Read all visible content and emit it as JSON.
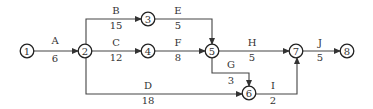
{
  "diagram": {
    "type": "activity-on-arrow network",
    "nodes": [
      {
        "id": "1",
        "label": "1",
        "x": 27,
        "y": 51
      },
      {
        "id": "2",
        "label": "2",
        "x": 85,
        "y": 51
      },
      {
        "id": "3",
        "label": "3",
        "x": 148,
        "y": 19
      },
      {
        "id": "4",
        "label": "4",
        "x": 148,
        "y": 51
      },
      {
        "id": "5",
        "label": "5",
        "x": 212,
        "y": 51
      },
      {
        "id": "6",
        "label": "6",
        "x": 249,
        "y": 93
      },
      {
        "id": "7",
        "label": "7",
        "x": 296,
        "y": 51
      },
      {
        "id": "8",
        "label": "8",
        "x": 347,
        "y": 51
      }
    ],
    "edges": [
      {
        "activity": "A",
        "duration": "6",
        "from": "1",
        "to": "2",
        "path": [
          [
            33,
            51
          ],
          [
            78,
            51
          ]
        ],
        "name_pos": [
          55,
          44
        ],
        "dur_pos": [
          55,
          62
        ]
      },
      {
        "activity": "B",
        "duration": "15",
        "from": "2",
        "to": "3",
        "path": [
          [
            86,
            45
          ],
          [
            86,
            19
          ],
          [
            141,
            19
          ]
        ],
        "name_pos": [
          116,
          14
        ],
        "dur_pos": [
          116,
          29
        ]
      },
      {
        "activity": "C",
        "duration": "12",
        "from": "2",
        "to": "4",
        "path": [
          [
            91,
            51
          ],
          [
            141,
            51
          ]
        ],
        "name_pos": [
          116,
          46
        ],
        "dur_pos": [
          116,
          61
        ]
      },
      {
        "activity": "D",
        "duration": "18",
        "from": "2",
        "to": "6",
        "path": [
          [
            86,
            57
          ],
          [
            86,
            94
          ],
          [
            242,
            94
          ]
        ],
        "name_pos": [
          148,
          89
        ],
        "dur_pos": [
          148,
          104
        ]
      },
      {
        "activity": "E",
        "duration": "5",
        "from": "3",
        "to": "5",
        "path": [
          [
            155,
            19
          ],
          [
            212,
            19
          ],
          [
            212,
            44
          ]
        ],
        "name_pos": [
          178,
          14
        ],
        "dur_pos": [
          178,
          29
        ]
      },
      {
        "activity": "F",
        "duration": "8",
        "from": "4",
        "to": "5",
        "path": [
          [
            155,
            51
          ],
          [
            205,
            51
          ]
        ],
        "name_pos": [
          178,
          46
        ],
        "dur_pos": [
          178,
          61
        ]
      },
      {
        "activity": "G",
        "duration": "3",
        "from": "5",
        "to": "6",
        "path": [
          [
            212,
            58
          ],
          [
            212,
            73
          ],
          [
            249,
            73
          ],
          [
            249,
            86
          ]
        ],
        "name_pos": [
          231,
          68
        ],
        "dur_pos": [
          231,
          84
        ]
      },
      {
        "activity": "H",
        "duration": "5",
        "from": "5",
        "to": "7",
        "path": [
          [
            219,
            51
          ],
          [
            289,
            51
          ]
        ],
        "name_pos": [
          252,
          46
        ],
        "dur_pos": [
          252,
          61
        ]
      },
      {
        "activity": "I",
        "duration": "2",
        "from": "6",
        "to": "7",
        "path": [
          [
            256,
            94
          ],
          [
            297,
            94
          ],
          [
            297,
            58
          ]
        ],
        "name_pos": [
          273,
          89
        ],
        "dur_pos": [
          273,
          104
        ]
      },
      {
        "activity": "J",
        "duration": "5",
        "from": "7",
        "to": "8",
        "path": [
          [
            303,
            51
          ],
          [
            340,
            51
          ]
        ],
        "name_pos": [
          320,
          46
        ],
        "dur_pos": [
          320,
          61
        ]
      }
    ]
  }
}
